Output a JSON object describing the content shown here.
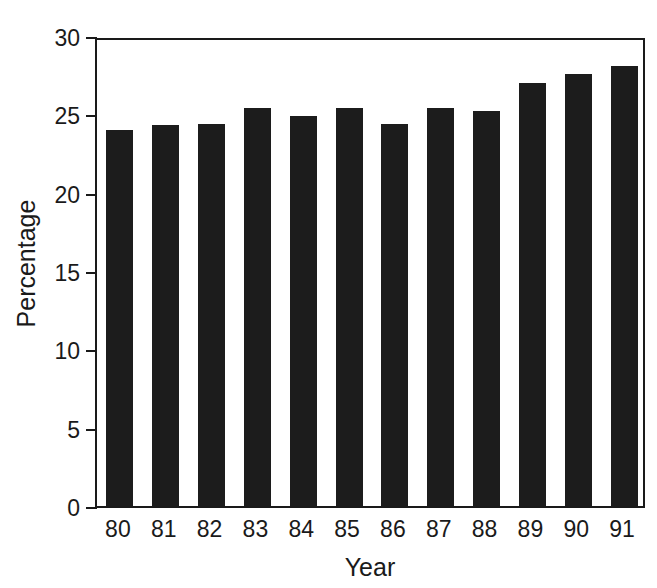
{
  "chart_data": {
    "type": "bar",
    "title": "",
    "xlabel": "Year",
    "ylabel": "Percentage",
    "categories": [
      "80",
      "81",
      "82",
      "83",
      "84",
      "85",
      "86",
      "87",
      "88",
      "89",
      "90",
      "91"
    ],
    "values": [
      24.0,
      24.3,
      24.4,
      25.4,
      24.9,
      25.4,
      24.4,
      25.4,
      25.2,
      27.0,
      27.6,
      28.1
    ],
    "ylim": [
      0,
      30
    ],
    "yticks": [
      0,
      5,
      10,
      15,
      20,
      25,
      30
    ],
    "ytick_labels": [
      "0",
      "5",
      "10",
      "15",
      "20",
      "25",
      "30"
    ],
    "grid": false,
    "legend": false,
    "bar_color": "#1c1c1c",
    "axis_color": "#1a1a1a",
    "background_color": "#ffffff"
  }
}
